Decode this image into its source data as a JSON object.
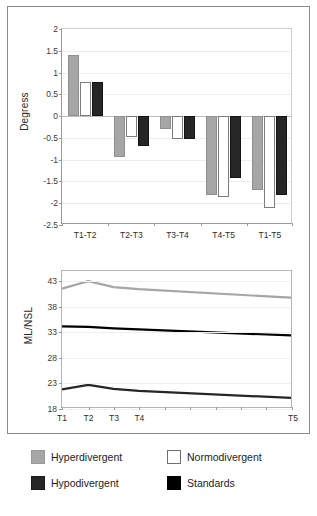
{
  "figure": {
    "background": "#ffffff",
    "frame_color": "#8a8a8a"
  },
  "colors": {
    "hyperdivergent": "#a6a6a6",
    "normodivergent": "#ffffff",
    "hypodivergent": "#262626",
    "standards": "#000000"
  },
  "legend": {
    "items": [
      {
        "label": "Hyperdivergent",
        "swatch": "hyper",
        "color": "#a6a6a6"
      },
      {
        "label": "Normodivergent",
        "swatch": "normo",
        "color": "#ffffff"
      },
      {
        "label": "Hypodivergent",
        "swatch": "hypo",
        "color": "#262626"
      },
      {
        "label": "Standards",
        "swatch": "std",
        "color": "#000000"
      }
    ]
  },
  "chart_data": [
    {
      "type": "bar",
      "title": "",
      "xlabel": "",
      "ylabel": "Degress",
      "categories": [
        "T1-T2",
        "T2-T3",
        "T3-T4",
        "T4-T5",
        "T1-T5"
      ],
      "ylim": [
        -2.5,
        2
      ],
      "yticks": [
        2,
        1.5,
        1,
        0.5,
        0,
        -0.5,
        -1,
        -1.5,
        -2,
        -2.5
      ],
      "ytick_labels": [
        "2",
        "1.5",
        "1",
        "0.5",
        "0",
        "-0.5",
        "-1",
        "-1.5",
        "-2",
        "-2.5"
      ],
      "grid": true,
      "legend_position": "bottom",
      "series": [
        {
          "name": "Hyperdivergent",
          "color": "#a6a6a6",
          "values": [
            1.4,
            -0.93,
            -0.3,
            -1.82,
            -1.7
          ]
        },
        {
          "name": "Normodivergent",
          "color": "#ffffff",
          "values": [
            0.78,
            -0.48,
            -0.52,
            -1.85,
            -2.1
          ]
        },
        {
          "name": "Hypodivergent",
          "color": "#262626",
          "values": [
            0.78,
            -0.69,
            -0.52,
            -1.42,
            -1.82
          ]
        }
      ]
    },
    {
      "type": "line",
      "title": "",
      "xlabel": "",
      "ylabel": "ML/NSL",
      "x": [
        "T1",
        "T2",
        "T3",
        "T4",
        "T5"
      ],
      "x_positions": [
        0,
        0.115,
        0.225,
        0.335,
        1.0
      ],
      "ylim": [
        18,
        45
      ],
      "yticks": [
        43,
        38,
        33,
        28,
        23,
        18
      ],
      "ytick_labels": [
        "43",
        "38",
        "33",
        "28",
        "23",
        "18"
      ],
      "grid": true,
      "legend_position": "bottom",
      "series": [
        {
          "name": "Hyperdivergent",
          "color": "#a6a6a6",
          "width": 2.2,
          "values": [
            41.5,
            43.0,
            41.8,
            41.4,
            39.7
          ]
        },
        {
          "name": "Standards",
          "color": "#000000",
          "width": 2.2,
          "values": [
            34.0,
            33.9,
            33.6,
            33.4,
            32.2
          ]
        },
        {
          "name": "Hypodivergent",
          "color": "#262626",
          "width": 2.2,
          "values": [
            21.5,
            22.4,
            21.6,
            21.2,
            19.8
          ]
        }
      ]
    }
  ]
}
